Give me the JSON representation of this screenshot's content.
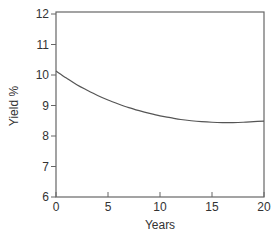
{
  "chart_data": {
    "type": "line",
    "title": "",
    "xlabel": "Years",
    "ylabel": "Yield %",
    "xlim": [
      0,
      20
    ],
    "ylim": [
      6,
      12
    ],
    "xticks": [
      0,
      5,
      10,
      15,
      20
    ],
    "yticks": [
      6,
      7,
      8,
      9,
      10,
      11,
      12
    ],
    "grid": false,
    "legend": null,
    "series": [
      {
        "name": "Yield curve",
        "color": "#555555",
        "x": [
          0,
          1,
          2,
          3,
          4,
          5,
          6,
          7,
          8,
          9,
          10,
          11,
          12,
          13,
          14,
          15,
          16,
          17,
          18,
          19,
          20
        ],
        "y": [
          10.13,
          9.9,
          9.68,
          9.5,
          9.33,
          9.18,
          9.05,
          8.93,
          8.83,
          8.74,
          8.66,
          8.6,
          8.54,
          8.5,
          8.47,
          8.45,
          8.44,
          8.44,
          8.45,
          8.47,
          8.49
        ]
      }
    ]
  },
  "labels": {
    "xlabel": "Years",
    "ylabel": "Yield %",
    "xticks": [
      "0",
      "5",
      "10",
      "15",
      "20"
    ],
    "yticks": [
      "6",
      "7",
      "8",
      "9",
      "10",
      "11",
      "12"
    ]
  }
}
